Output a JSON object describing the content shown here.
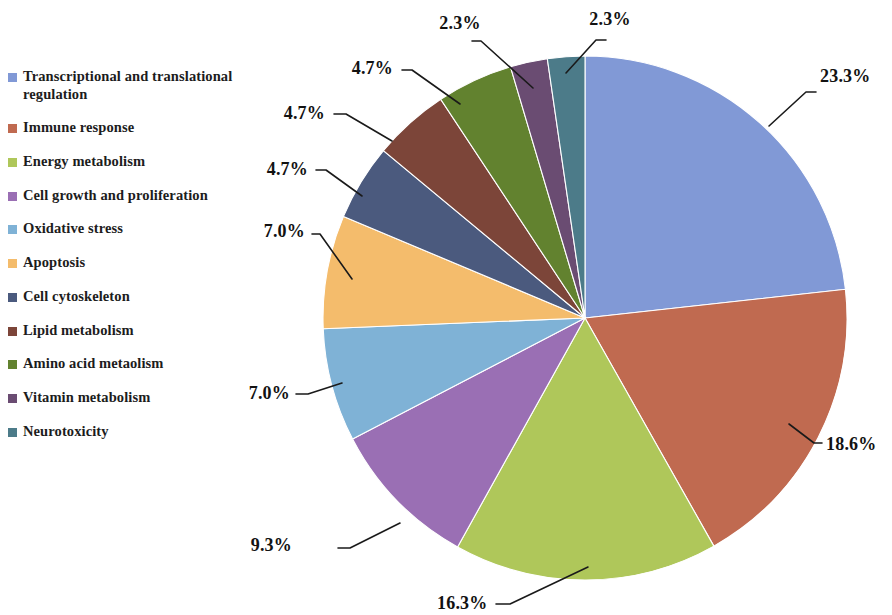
{
  "chart_data": {
    "type": "pie",
    "title": "",
    "subtitle": "",
    "xlabel": "",
    "ylabel": "",
    "legend_position": "left",
    "grid": false,
    "value_unit": "%",
    "categories": [
      "Transcriptional and translational regulation",
      "Immune response",
      "Energy metabolism",
      "Cell growth and proliferation",
      "Oxidative stress",
      "Apoptosis",
      "Cell cytoskeleton",
      "Lipid metabolism",
      "Amino acid metaolism",
      "Vitamin metabolism",
      "Neurotoxicity"
    ],
    "values": [
      23.3,
      18.6,
      16.3,
      9.3,
      7.0,
      7.0,
      4.7,
      4.7,
      4.7,
      2.3,
      2.3
    ],
    "labels": [
      "23.3%",
      "18.6%",
      "16.3%",
      "9.3%",
      "7.0%",
      "7.0%",
      "4.7%",
      "4.7%",
      "4.7%",
      "2.3%",
      "2.3%"
    ],
    "colors": [
      "#8199D6",
      "#C06A50",
      "#AFC75A",
      "#9A6FB4",
      "#7FB2D6",
      "#F4BC6C",
      "#4B5A7E",
      "#7C4539",
      "#62822F",
      "#6A4C72",
      "#4C7B89"
    ],
    "start_angle_deg": -90,
    "direction": "clockwise"
  },
  "legend": {
    "items": [
      {
        "label": "Transcriptional and translational regulation",
        "color": "#8199D6"
      },
      {
        "label": "Immune response",
        "color": "#C06A50"
      },
      {
        "label": "Energy metabolism",
        "color": "#AFC75A"
      },
      {
        "label": "Cell growth and proliferation",
        "color": "#9A6FB4"
      },
      {
        "label": "Oxidative stress",
        "color": "#7FB2D6"
      },
      {
        "label": "Apoptosis",
        "color": "#F4BC6C"
      },
      {
        "label": "Cell cytoskeleton",
        "color": "#4B5A7E"
      },
      {
        "label": "Lipid metabolism",
        "color": "#7C4539"
      },
      {
        "label": "Amino acid metaolism",
        "color": "#62822F"
      },
      {
        "label": "Vitamin metabolism",
        "color": "#6A4C72"
      },
      {
        "label": "Neurotoxicity",
        "color": "#4C7B89"
      }
    ]
  },
  "geometry": {
    "center_x": 585,
    "center_y": 318,
    "radius": 262
  },
  "callouts": [
    {
      "text": "23.3%",
      "tx": 820,
      "ty": 82,
      "anchor": "start",
      "path": "M 769,126 L 806,92 L 816,92"
    },
    {
      "text": "18.6%",
      "tx": 826,
      "ty": 450,
      "anchor": "start",
      "path": "M 789,424 L 814,443 L 822,443"
    },
    {
      "text": "16.3%",
      "tx": 437,
      "ty": 609,
      "anchor": "start",
      "path": "M 588,567 L 510,604 L 496,604"
    },
    {
      "text": "9.3%",
      "tx": 292,
      "ty": 551,
      "anchor": "end",
      "path": "M 400,523 L 350,548 L 338,548"
    },
    {
      "text": "7.0%",
      "tx": 290,
      "ty": 399,
      "anchor": "end",
      "path": "M 342,383 L 308,394 L 296,394"
    },
    {
      "text": "7.0%",
      "tx": 305,
      "ty": 237,
      "anchor": "end",
      "path": "M 352,279 L 320,234 L 312,234"
    },
    {
      "text": "4.7%",
      "tx": 308,
      "ty": 175,
      "anchor": "end",
      "path": "M 362,196 L 326,170 L 316,170"
    },
    {
      "text": "4.7%",
      "tx": 325,
      "ty": 119,
      "anchor": "end",
      "path": "M 392,141 L 346,114 L 334,114"
    },
    {
      "text": "4.7%",
      "tx": 393,
      "ty": 74,
      "anchor": "end",
      "path": "M 460,104 L 412,70 L 402,70"
    },
    {
      "text": "2.3%",
      "tx": 460,
      "ty": 29,
      "anchor": "middle",
      "path": "M 533,88 L 481,41 L 472,41"
    },
    {
      "text": "2.3%",
      "tx": 610,
      "ty": 25,
      "anchor": "middle",
      "path": "M 566,73 L 596,40 L 606,40"
    }
  ]
}
